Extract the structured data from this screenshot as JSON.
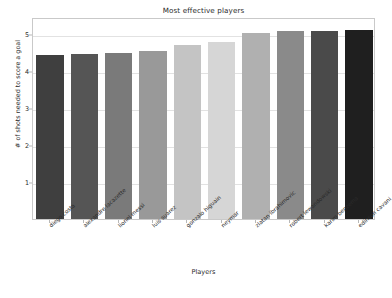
{
  "chart_data": {
    "type": "bar",
    "title": "Most effective players",
    "xlabel": "Players",
    "ylabel": "# of shots needed to score a goal",
    "categories": [
      "diego costa",
      "alexandre lacazette",
      "lionel messi",
      "luis suarez",
      "gonzalo higuain",
      "neymar",
      "zlatan ibrahimovic",
      "robert lewandowski",
      "karim benzema",
      "edinson cavani"
    ],
    "values": [
      4.43,
      4.46,
      4.48,
      4.53,
      4.69,
      4.77,
      5.03,
      5.08,
      5.08,
      5.1
    ],
    "bar_colors": [
      "#3f3f3f",
      "#555555",
      "#7a7a7a",
      "#999999",
      "#c4c4c4",
      "#d6d6d6",
      "#b0b0b0",
      "#8a8a8a",
      "#4a4a4a",
      "#1f1f1f"
    ],
    "ylim": [
      0,
      5.45
    ],
    "yticks": [
      1,
      2,
      3,
      4,
      5
    ],
    "ytick_labels": [
      "1",
      "2",
      "3",
      "4",
      "5"
    ],
    "grid": true,
    "legend": false
  }
}
